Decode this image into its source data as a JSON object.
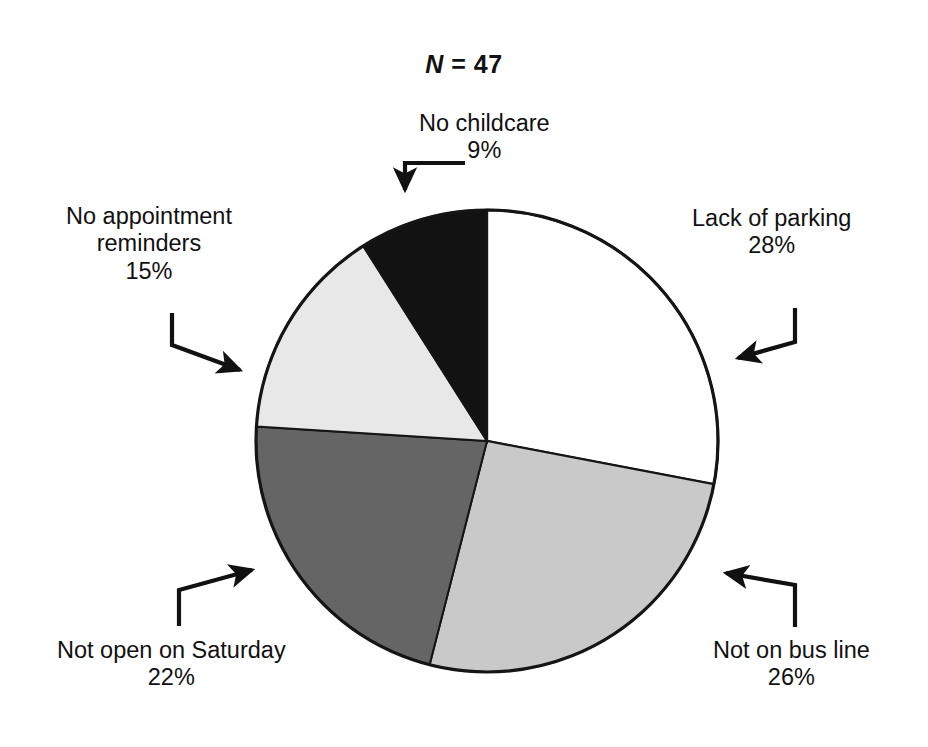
{
  "figure": {
    "title_prefix": "N",
    "title_rest": " = 47",
    "background_color": "#ffffff",
    "outline_color": "#111111"
  },
  "chart_data": {
    "type": "pie",
    "title": "N = 47",
    "sample_size": 47,
    "start_angle_deg": 0,
    "direction": "clockwise",
    "units": "percent",
    "total": 100,
    "categories": [
      "Lack of parking",
      "Not on bus line",
      "Not open on Saturday",
      "No appointment reminders",
      "No childcare"
    ],
    "values": [
      28,
      26,
      22,
      15,
      9
    ],
    "value_labels": [
      "28%",
      "26%",
      "22%",
      "15%",
      "9%"
    ],
    "slice_colors": [
      "#ffffff",
      "#c9c9c9",
      "#656565",
      "#e8e8e8",
      "#121212"
    ],
    "slices": [
      {
        "label": "Lack of parking",
        "value": 28,
        "value_label": "28%",
        "color": "#ffffff",
        "start_deg": 0,
        "end_deg": 100.8
      },
      {
        "label": "Not on bus line",
        "value": 26,
        "value_label": "26%",
        "color": "#c9c9c9",
        "start_deg": 100.8,
        "end_deg": 194.4
      },
      {
        "label": "Not open on Saturday",
        "value": 22,
        "value_label": "22%",
        "color": "#656565",
        "start_deg": 194.4,
        "end_deg": 273.6
      },
      {
        "label": "No appointment reminders",
        "value": 15,
        "value_label": "15%",
        "color": "#e8e8e8",
        "start_deg": 273.6,
        "end_deg": 327.6
      },
      {
        "label": "No childcare",
        "value": 9,
        "value_label": "9%",
        "color": "#121212",
        "start_deg": 327.6,
        "end_deg": 360
      }
    ],
    "legend": "none",
    "labels_position": "external-with-leader-arrows",
    "grid": false
  },
  "callouts": {
    "no_childcare": {
      "name": "No childcare",
      "percent": "9%"
    },
    "lack_of_parking": {
      "name": "Lack of parking",
      "percent": "28%"
    },
    "not_on_bus_line": {
      "name": "Not on bus line",
      "percent": "26%"
    },
    "not_open_saturday": {
      "name": "Not open on Saturday",
      "percent": "22%"
    },
    "no_appt_reminders_line1": "No appointment",
    "no_appt_reminders_line2": "reminders",
    "no_appt_reminders_percent": "15%"
  }
}
